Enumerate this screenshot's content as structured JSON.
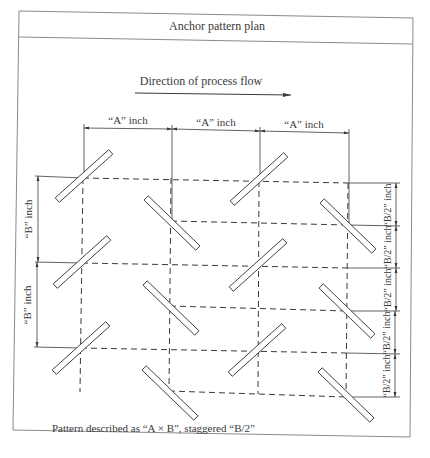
{
  "figure": {
    "title": "Anchor pattern plan",
    "flow_label": "Direction of process flow",
    "caption": "Pattern described as “A × B”, staggered “B/2”"
  },
  "dimensions": {
    "horizontal": [
      {
        "label": "“A” inch"
      },
      {
        "label": "“A” inch"
      },
      {
        "label": "“A” inch"
      }
    ],
    "left_vertical": [
      {
        "label": "“B” inch"
      },
      {
        "label": "“B” inch"
      }
    ],
    "right_vertical": [
      {
        "label": "“B/2” inch"
      },
      {
        "label": "“B/2” inch"
      },
      {
        "label": "“B/2” inch"
      },
      {
        "label": "“B/2” inch"
      },
      {
        "label": "“B/2” inch"
      }
    ]
  },
  "anchors": {
    "orientation_note": "Anchors alternate orientation by column: columns 1 and 3 tilted up-right, columns 2 and 4 tilted down-right",
    "columns": [
      {
        "x_index": 1,
        "rows": 3,
        "orientation": "up-right"
      },
      {
        "x_index": 2,
        "rows": 3,
        "orientation": "down-right",
        "offset": "B/2"
      },
      {
        "x_index": 3,
        "rows": 3,
        "orientation": "up-right"
      },
      {
        "x_index": 4,
        "rows": 3,
        "orientation": "down-right",
        "offset": "B/2"
      }
    ]
  },
  "colors": {
    "line": "#3a3a3a",
    "frame": "#8a8a8a",
    "background": "#ffffff"
  }
}
